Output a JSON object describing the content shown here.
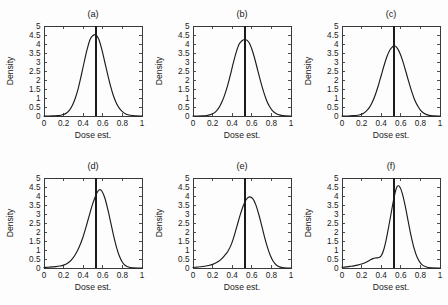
{
  "figure": {
    "background_color": "#fdfdfd",
    "axis_color": "#3a3a3a",
    "curve_color": "#1b1b1b",
    "rows": 2,
    "cols": 3
  },
  "chart_data": [
    {
      "type": "line",
      "title": "(a)",
      "xlabel": "Dose est.",
      "ylabel": "Density",
      "xlim": [
        0,
        1
      ],
      "ylim": [
        0,
        5
      ],
      "xticks": [
        0,
        0.2,
        0.4,
        0.6,
        0.8,
        1
      ],
      "xticklabels": [
        "0",
        "0.2",
        "0.4",
        "0.6",
        "0.8",
        "1"
      ],
      "yticks": [
        0,
        0.5,
        1,
        1.5,
        2,
        2.5,
        3,
        3.5,
        4,
        4.5,
        5
      ],
      "yticklabels": [
        "0",
        "0.5",
        "1",
        "1.5",
        "2",
        "2.5",
        "3",
        "3.5",
        "4",
        "4.5",
        "5"
      ],
      "grid": false,
      "legend": "none",
      "vertical_reference_line": 0.53,
      "peak_x": 0.53,
      "peak_y": 4.5,
      "series": [
        {
          "name": "density",
          "x": [
            0.0,
            0.05,
            0.1,
            0.14,
            0.17,
            0.2,
            0.23,
            0.26,
            0.29,
            0.32,
            0.35,
            0.38,
            0.41,
            0.44,
            0.47,
            0.5,
            0.53,
            0.56,
            0.59,
            0.62,
            0.65,
            0.68,
            0.71,
            0.74,
            0.77,
            0.8,
            0.84,
            0.88,
            0.93,
            1.0
          ],
          "y": [
            0.0,
            0.0,
            0.01,
            0.02,
            0.04,
            0.08,
            0.17,
            0.33,
            0.6,
            1.0,
            1.55,
            2.25,
            3.0,
            3.7,
            4.25,
            4.47,
            4.5,
            4.25,
            3.7,
            3.0,
            2.3,
            1.65,
            1.1,
            0.7,
            0.42,
            0.24,
            0.1,
            0.04,
            0.01,
            0.0
          ]
        }
      ]
    },
    {
      "type": "line",
      "title": "(b)",
      "xlabel": "Dose est.",
      "ylabel": "Density",
      "xlim": [
        0,
        1
      ],
      "ylim": [
        0,
        5
      ],
      "xticks": [
        0,
        0.2,
        0.4,
        0.6,
        0.8,
        1
      ],
      "xticklabels": [
        "0",
        "0.2",
        "0.4",
        "0.6",
        "0.8",
        "1"
      ],
      "yticks": [
        0,
        0.5,
        1,
        1.5,
        2,
        2.5,
        3,
        3.5,
        4,
        4.5,
        5
      ],
      "yticklabels": [
        "0",
        "0.5",
        "1",
        "1.5",
        "2",
        "2.5",
        "3",
        "3.5",
        "4",
        "4.5",
        "5"
      ],
      "grid": false,
      "legend": "none",
      "vertical_reference_line": 0.53,
      "peak_x": 0.535,
      "peak_y": 4.25,
      "series": [
        {
          "name": "density",
          "x": [
            0.0,
            0.05,
            0.1,
            0.14,
            0.17,
            0.2,
            0.23,
            0.26,
            0.29,
            0.32,
            0.35,
            0.38,
            0.41,
            0.44,
            0.47,
            0.5,
            0.535,
            0.57,
            0.6,
            0.63,
            0.66,
            0.69,
            0.72,
            0.75,
            0.78,
            0.81,
            0.85,
            0.89,
            0.94,
            1.0
          ],
          "y": [
            0.0,
            0.0,
            0.01,
            0.03,
            0.06,
            0.12,
            0.23,
            0.42,
            0.72,
            1.12,
            1.63,
            2.25,
            2.92,
            3.52,
            3.98,
            4.18,
            4.25,
            4.1,
            3.72,
            3.18,
            2.55,
            1.92,
            1.35,
            0.88,
            0.54,
            0.3,
            0.13,
            0.05,
            0.01,
            0.0
          ]
        }
      ]
    },
    {
      "type": "line",
      "title": "(c)",
      "xlabel": "Dose est.",
      "ylabel": "Density",
      "xlim": [
        0,
        1
      ],
      "ylim": [
        0,
        5
      ],
      "xticks": [
        0,
        0.2,
        0.4,
        0.6,
        0.8,
        1
      ],
      "xticklabels": [
        "0",
        "0.2",
        "0.4",
        "0.6",
        "0.8",
        "1"
      ],
      "yticks": [
        0,
        0.5,
        1,
        1.5,
        2,
        2.5,
        3,
        3.5,
        4,
        4.5,
        5
      ],
      "yticklabels": [
        "0",
        "0.5",
        "1",
        "1.5",
        "2",
        "2.5",
        "3",
        "3.5",
        "4",
        "4.5",
        "5"
      ],
      "grid": false,
      "legend": "none",
      "vertical_reference_line": 0.53,
      "peak_x": 0.535,
      "peak_y": 3.9,
      "series": [
        {
          "name": "density",
          "x": [
            0.0,
            0.06,
            0.12,
            0.16,
            0.19,
            0.22,
            0.25,
            0.28,
            0.31,
            0.34,
            0.37,
            0.4,
            0.43,
            0.46,
            0.49,
            0.52,
            0.535,
            0.56,
            0.59,
            0.62,
            0.65,
            0.68,
            0.71,
            0.74,
            0.77,
            0.8,
            0.84,
            0.88,
            0.93,
            1.0
          ],
          "y": [
            0.0,
            0.0,
            0.02,
            0.04,
            0.08,
            0.15,
            0.28,
            0.48,
            0.78,
            1.18,
            1.68,
            2.25,
            2.82,
            3.32,
            3.68,
            3.87,
            3.9,
            3.8,
            3.5,
            3.05,
            2.5,
            1.92,
            1.38,
            0.92,
            0.58,
            0.33,
            0.14,
            0.05,
            0.01,
            0.0
          ]
        }
      ]
    },
    {
      "type": "line",
      "title": "(d)",
      "xlabel": "Dose est.",
      "ylabel": "Density",
      "xlim": [
        0,
        1
      ],
      "ylim": [
        0,
        5
      ],
      "xticks": [
        0,
        0.2,
        0.4,
        0.6,
        0.8,
        1
      ],
      "xticklabels": [
        "0",
        "0.2",
        "0.4",
        "0.6",
        "0.8",
        "1"
      ],
      "yticks": [
        0,
        0.5,
        1,
        1.5,
        2,
        2.5,
        3,
        3.5,
        4,
        4.5,
        5
      ],
      "yticklabels": [
        "0",
        "0.5",
        "1",
        "1.5",
        "2",
        "2.5",
        "3",
        "3.5",
        "4",
        "4.5",
        "5"
      ],
      "grid": false,
      "legend": "none",
      "vertical_reference_line": 0.53,
      "peak_x": 0.565,
      "peak_y": 4.35,
      "series": [
        {
          "name": "density",
          "x": [
            0.0,
            0.04,
            0.08,
            0.12,
            0.16,
            0.2,
            0.24,
            0.28,
            0.32,
            0.36,
            0.4,
            0.43,
            0.46,
            0.49,
            0.52,
            0.545,
            0.565,
            0.59,
            0.62,
            0.65,
            0.68,
            0.71,
            0.74,
            0.77,
            0.8,
            0.83,
            0.87,
            0.91,
            0.95,
            1.0
          ],
          "y": [
            0.02,
            0.04,
            0.06,
            0.08,
            0.11,
            0.16,
            0.26,
            0.45,
            0.75,
            1.18,
            1.75,
            2.3,
            2.88,
            3.45,
            3.92,
            4.22,
            4.35,
            4.28,
            3.9,
            3.28,
            2.55,
            1.8,
            1.15,
            0.65,
            0.32,
            0.14,
            0.04,
            0.01,
            0.0,
            0.0
          ]
        }
      ]
    },
    {
      "type": "line",
      "title": "(e)",
      "xlabel": "Dose est.",
      "ylabel": "Density",
      "xlim": [
        0,
        1
      ],
      "ylim": [
        0,
        5
      ],
      "xticks": [
        0,
        0.2,
        0.4,
        0.6,
        0.8,
        1
      ],
      "xticklabels": [
        "0",
        "0.2",
        "0.4",
        "0.6",
        "0.8",
        "1"
      ],
      "yticks": [
        0,
        0.5,
        1,
        1.5,
        2,
        2.5,
        3,
        3.5,
        4,
        4.5,
        5
      ],
      "yticklabels": [
        "0",
        "0.5",
        "1",
        "1.5",
        "2",
        "2.5",
        "3",
        "3.5",
        "4",
        "4.5",
        "5"
      ],
      "grid": false,
      "legend": "none",
      "vertical_reference_line": 0.53,
      "peak_x": 0.575,
      "peak_y": 3.95,
      "series": [
        {
          "name": "density",
          "x": [
            0.0,
            0.04,
            0.08,
            0.12,
            0.16,
            0.2,
            0.24,
            0.28,
            0.32,
            0.355,
            0.39,
            0.42,
            0.45,
            0.48,
            0.51,
            0.54,
            0.575,
            0.61,
            0.64,
            0.67,
            0.7,
            0.73,
            0.76,
            0.79,
            0.82,
            0.85,
            0.89,
            0.93,
            0.96,
            1.0
          ],
          "y": [
            0.03,
            0.05,
            0.07,
            0.1,
            0.14,
            0.2,
            0.3,
            0.45,
            0.68,
            0.92,
            1.3,
            1.78,
            2.35,
            2.92,
            3.42,
            3.78,
            3.95,
            3.85,
            3.52,
            3.0,
            2.38,
            1.72,
            1.15,
            0.68,
            0.36,
            0.17,
            0.05,
            0.01,
            0.0,
            0.0
          ]
        }
      ]
    },
    {
      "type": "line",
      "title": "(f)",
      "xlabel": "Dose est.",
      "ylabel": "Density",
      "xlim": [
        0,
        1
      ],
      "ylim": [
        0,
        5
      ],
      "xticks": [
        0,
        0.2,
        0.4,
        0.6,
        0.8,
        1
      ],
      "xticklabels": [
        "0",
        "0.2",
        "0.4",
        "0.6",
        "0.8",
        "1"
      ],
      "yticks": [
        0,
        0.5,
        1,
        1.5,
        2,
        2.5,
        3,
        3.5,
        4,
        4.5,
        5
      ],
      "yticklabels": [
        "0",
        "0.5",
        "1",
        "1.5",
        "2",
        "2.5",
        "3",
        "3.5",
        "4",
        "4.5",
        "5"
      ],
      "grid": false,
      "legend": "none",
      "vertical_reference_line": 0.53,
      "peak_x": 0.565,
      "peak_y": 4.55,
      "series": [
        {
          "name": "density",
          "x": [
            0.0,
            0.04,
            0.08,
            0.12,
            0.16,
            0.2,
            0.24,
            0.28,
            0.315,
            0.345,
            0.375,
            0.4,
            0.425,
            0.45,
            0.475,
            0.5,
            0.525,
            0.545,
            0.565,
            0.59,
            0.615,
            0.645,
            0.675,
            0.705,
            0.735,
            0.77,
            0.81,
            0.855,
            0.91,
            1.0
          ],
          "y": [
            0.04,
            0.06,
            0.09,
            0.12,
            0.16,
            0.22,
            0.3,
            0.42,
            0.52,
            0.56,
            0.58,
            0.68,
            1.0,
            1.55,
            2.25,
            3.0,
            3.75,
            4.25,
            4.55,
            4.5,
            4.15,
            3.45,
            2.6,
            1.78,
            1.1,
            0.55,
            0.22,
            0.07,
            0.01,
            0.0
          ]
        }
      ]
    }
  ]
}
